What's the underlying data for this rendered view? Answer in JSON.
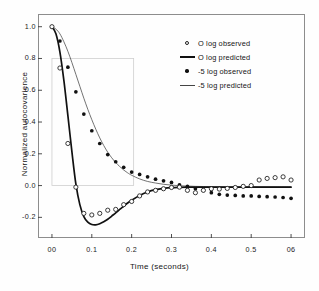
{
  "figure": {
    "background": "#fefefe",
    "frame_color": "#8d8d8d"
  },
  "chart_data": {
    "type": "scatter",
    "title": "",
    "xlabel": "Time (seconds)",
    "ylabel": "Normalized autocovarience",
    "xlim": [
      -0.035,
      0.635
    ],
    "ylim": [
      -0.33,
      1.08
    ],
    "xticks": [
      0.0,
      0.1,
      0.2,
      0.3,
      0.4,
      0.5,
      0.6
    ],
    "xticklabels": [
      "00",
      "0.1",
      "0.2",
      "0.3",
      "0.4",
      "0.5",
      "06"
    ],
    "yticks": [
      1.0,
      0.8,
      0.6,
      0.4,
      0.2,
      0.0,
      -0.2
    ],
    "yticklabels": [
      "1.0",
      "0.8",
      "0.6",
      "0.4",
      "0.2",
      "0.0",
      "-0.2"
    ],
    "grid": false,
    "legend_position": "upper right",
    "series": [
      {
        "name": "O log observed",
        "marker": "open-circle",
        "color": "#1a1a1a",
        "x": [
          0.0,
          0.02,
          0.04,
          0.06,
          0.08,
          0.1,
          0.12,
          0.14,
          0.16,
          0.18,
          0.2,
          0.22,
          0.24,
          0.26,
          0.28,
          0.3,
          0.32,
          0.34,
          0.36,
          0.38,
          0.4,
          0.42,
          0.44,
          0.46,
          0.48,
          0.5,
          0.52,
          0.54,
          0.56,
          0.58,
          0.6
        ],
        "y": [
          1.0,
          0.74,
          0.265,
          -0.01,
          -0.175,
          -0.185,
          -0.175,
          -0.155,
          -0.15,
          -0.12,
          -0.1,
          -0.065,
          -0.04,
          -0.03,
          -0.02,
          -0.012,
          -0.01,
          -0.03,
          -0.045,
          -0.03,
          -0.02,
          -0.022,
          -0.018,
          -0.012,
          -0.005,
          0.0,
          0.035,
          0.045,
          0.05,
          0.055,
          0.035
        ]
      },
      {
        "name": "O log predicted",
        "marker": "line-thick",
        "color": "#111111",
        "x": [
          0.0,
          0.01,
          0.02,
          0.03,
          0.04,
          0.05,
          0.06,
          0.07,
          0.08,
          0.09,
          0.1,
          0.11,
          0.12,
          0.13,
          0.14,
          0.15,
          0.16,
          0.17,
          0.18,
          0.19,
          0.2,
          0.22,
          0.24,
          0.26,
          0.28,
          0.3,
          0.32,
          0.34,
          0.36,
          0.38,
          0.4,
          0.44,
          0.48,
          0.52,
          0.56,
          0.6
        ],
        "y": [
          1.0,
          0.955,
          0.84,
          0.66,
          0.44,
          0.215,
          0.01,
          -0.12,
          -0.195,
          -0.23,
          -0.245,
          -0.247,
          -0.24,
          -0.228,
          -0.212,
          -0.192,
          -0.172,
          -0.15,
          -0.13,
          -0.11,
          -0.092,
          -0.062,
          -0.04,
          -0.026,
          -0.018,
          -0.013,
          -0.011,
          -0.01,
          -0.01,
          -0.01,
          -0.01,
          -0.01,
          -0.01,
          -0.01,
          -0.01,
          -0.01
        ]
      },
      {
        "name": "-5 log observed",
        "marker": "filled-circle",
        "color": "#111111",
        "x": [
          0.0,
          0.02,
          0.04,
          0.06,
          0.08,
          0.1,
          0.12,
          0.14,
          0.16,
          0.18,
          0.2,
          0.22,
          0.24,
          0.26,
          0.28,
          0.3,
          0.32,
          0.34,
          0.36,
          0.38,
          0.4,
          0.42,
          0.44,
          0.46,
          0.48,
          0.5,
          0.52,
          0.54,
          0.56,
          0.58,
          0.6
        ],
        "y": [
          1.0,
          0.91,
          0.745,
          0.59,
          0.45,
          0.345,
          0.265,
          0.195,
          0.15,
          0.115,
          0.085,
          0.07,
          0.055,
          0.04,
          0.03,
          0.02,
          0.005,
          -0.005,
          -0.02,
          -0.03,
          -0.045,
          -0.055,
          -0.06,
          -0.062,
          -0.065,
          -0.065,
          -0.068,
          -0.07,
          -0.072,
          -0.075,
          -0.08
        ]
      },
      {
        "name": "-5 log predicted",
        "marker": "line-thin",
        "color": "#444444",
        "x": [
          0.0,
          0.01,
          0.02,
          0.03,
          0.04,
          0.05,
          0.06,
          0.07,
          0.08,
          0.09,
          0.1,
          0.11,
          0.12,
          0.13,
          0.14,
          0.15,
          0.16,
          0.17,
          0.18,
          0.19,
          0.2,
          0.22,
          0.24,
          0.26,
          0.28,
          0.3,
          0.32,
          0.34,
          0.36,
          0.38,
          0.4,
          0.44,
          0.48,
          0.52,
          0.56,
          0.6
        ],
        "y": [
          1.0,
          0.985,
          0.955,
          0.905,
          0.845,
          0.775,
          0.7,
          0.625,
          0.55,
          0.48,
          0.415,
          0.355,
          0.3,
          0.252,
          0.21,
          0.175,
          0.145,
          0.12,
          0.098,
          0.08,
          0.065,
          0.042,
          0.026,
          0.016,
          0.008,
          0.003,
          -0.001,
          -0.003,
          -0.005,
          -0.006,
          -0.007,
          -0.008,
          -0.008,
          -0.008,
          -0.008,
          -0.008
        ]
      }
    ]
  },
  "legend": {
    "items": [
      {
        "label": "O log observed",
        "key": "open-circle"
      },
      {
        "label": "O log predicted",
        "key": "line-thick"
      },
      {
        "label": "-5 log observed",
        "key": "filled-circle"
      },
      {
        "label": "-5 log predicted",
        "key": "line-thin"
      }
    ]
  }
}
